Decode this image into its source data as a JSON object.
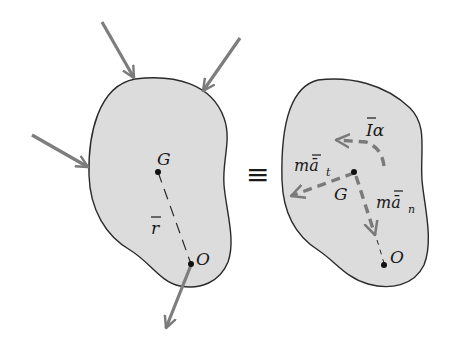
{
  "diagram": {
    "title": "",
    "colors": {
      "body_fill": "#dcdcdc",
      "body_stroke": "#2a2a2a",
      "force_arrow": "#7d7d7d",
      "dashed_vector": "#7a7a7a",
      "text": "#1a1a1a"
    },
    "left_body": {
      "point_G_label": "G",
      "point_O_label": "O",
      "r_bar_label": "r",
      "applied_forces": 4
    },
    "equivalence_symbol": "≡",
    "right_body": {
      "point_G_label": "G",
      "point_O_label": "O",
      "moment_label": "Iα",
      "tangential_label_main": "mā",
      "tangential_subscript": "t",
      "normal_label_main": "mā",
      "normal_subscript": "n"
    }
  }
}
